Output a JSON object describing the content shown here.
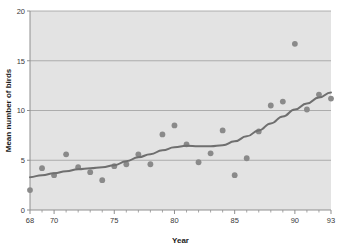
{
  "chart_data": {
    "type": "scatter",
    "title": "",
    "xlabel": "Year",
    "ylabel": "Mean number of birds",
    "xlim": [
      68,
      93
    ],
    "ylim": [
      0,
      20
    ],
    "grid": "horizontal",
    "legend": "none",
    "x_tick_labels": [
      "68",
      "70",
      "75",
      "80",
      "85",
      "90",
      "93"
    ],
    "x_tick_values": [
      68,
      70,
      75,
      80,
      85,
      90,
      93
    ],
    "x_minor_ticks": [
      69,
      71,
      72,
      73,
      74,
      76,
      77,
      78,
      79,
      81,
      82,
      83,
      84,
      86,
      87,
      88,
      89,
      91,
      92
    ],
    "y_tick_labels": [
      "0",
      "5",
      "10",
      "15",
      "20"
    ],
    "y_tick_values": [
      0,
      5,
      10,
      15,
      20
    ],
    "series": [
      {
        "name": "Mean number of birds",
        "type": "scatter",
        "marker": "filled-circle",
        "color": "#8a8a8a",
        "x": [
          68,
          69,
          70,
          71,
          72,
          73,
          74,
          75,
          76,
          77,
          78,
          79,
          80,
          81,
          82,
          83,
          84,
          85,
          86,
          87,
          88,
          89,
          90,
          91,
          92,
          93
        ],
        "values": [
          2.0,
          4.2,
          3.5,
          5.6,
          4.3,
          3.8,
          3.0,
          4.4,
          4.6,
          5.6,
          4.6,
          7.6,
          8.5,
          6.6,
          4.8,
          5.7,
          8.0,
          3.5,
          5.2,
          7.9,
          10.5,
          10.9,
          16.7,
          10.1,
          11.6,
          11.2
        ]
      },
      {
        "name": "Smoothed trend",
        "type": "line",
        "color": "#6f6f6f",
        "x": [
          68,
          69,
          70,
          71,
          72,
          73,
          74,
          75,
          76,
          77,
          78,
          79,
          80,
          81,
          82,
          83,
          84,
          85,
          86,
          87,
          88,
          89,
          90,
          91,
          92,
          93
        ],
        "values": [
          3.3,
          3.5,
          3.7,
          3.9,
          4.1,
          4.2,
          4.3,
          4.5,
          4.9,
          5.3,
          5.6,
          6.0,
          6.3,
          6.45,
          6.4,
          6.4,
          6.5,
          6.9,
          7.4,
          8.0,
          8.7,
          9.4,
          10.1,
          10.7,
          11.3,
          11.8
        ]
      }
    ]
  },
  "style": {
    "plot_background": "#e3e3e3",
    "page_background": "#ffffff",
    "gridline_color": "#9e9e9e",
    "axis_color": "#8f8f8f",
    "marker_color": "#8a8a8a",
    "line_color": "#6f6f6f",
    "text_color": "#262626"
  }
}
